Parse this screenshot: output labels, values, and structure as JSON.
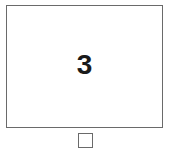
{
  "tile": {
    "number": "3"
  },
  "checkbox": {
    "checked": false
  }
}
